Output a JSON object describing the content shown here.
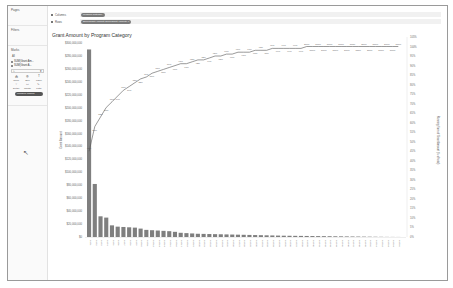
{
  "side_panel": {
    "pages_label": "Pages",
    "filters_label": "Filters",
    "marks_label": "Marks",
    "mark_type": "All",
    "mark_fields": [
      "SUM(Grant Am...",
      "SUM(Grant A..."
    ],
    "mark_buttons": [
      {
        "label": "Color",
        "glyph": "⁂"
      },
      {
        "label": "Size",
        "glyph": "◍"
      },
      {
        "label": "Label",
        "glyph": "T"
      },
      {
        "label": "Detail",
        "glyph": "⁘"
      },
      {
        "label": "Tooltip",
        "glyph": "▭"
      },
      {
        "label": "Path",
        "glyph": "∿"
      }
    ],
    "mark_pill": "Measure Names"
  },
  "shelves": {
    "columns_label": "Columns",
    "columns_pill": "Program Category",
    "rows_label": "Rows",
    "rows_pill": "SUM(Grant Amount)  SUM(Grant Amount) Δ"
  },
  "chart_data": {
    "type": "bar",
    "title": "Grant Amount by Program Category",
    "ylabel": "Grant Amount",
    "y2label": "Running Sum of Grant Amount (% of total)",
    "ylim": [
      0,
      300000000
    ],
    "y2lim": [
      0,
      1.0
    ],
    "y_ticks": [
      "$0",
      "$20,000,000",
      "$40,000,000",
      "$60,000,000",
      "$80,000,000",
      "$100,000,000",
      "$120,000,000",
      "$140,000,000",
      "$160,000,000",
      "$180,000,000",
      "$200,000,000",
      "$220,000,000",
      "$240,000,000",
      "$260,000,000",
      "$280,000,000",
      "$300,000,000"
    ],
    "y2_ticks": [
      "0%",
      "5%",
      "10%",
      "15%",
      "20%",
      "25%",
      "30%",
      "35%",
      "40%",
      "45%",
      "50%",
      "55%",
      "60%",
      "65%",
      "70%",
      "75%",
      "80%",
      "85%",
      "90%",
      "95%",
      "100%",
      "105%"
    ],
    "grid": false,
    "legend": "none",
    "categories": [
      "Cat 1",
      "Cat 2",
      "Cat 3",
      "Cat 4",
      "Cat 5",
      "Cat 6",
      "Cat 7",
      "Cat 8",
      "Cat 9",
      "Cat 10",
      "Cat 11",
      "Cat 12",
      "Cat 13",
      "Cat 14",
      "Cat 15",
      "Cat 16",
      "Cat 17",
      "Cat 18",
      "Cat 19",
      "Cat 20",
      "Cat 21",
      "Cat 22",
      "Cat 23",
      "Cat 24",
      "Cat 25",
      "Cat 26",
      "Cat 27",
      "Cat 28",
      "Cat 29",
      "Cat 30",
      "Cat 31",
      "Cat 32",
      "Cat 33",
      "Cat 34",
      "Cat 35",
      "Cat 36",
      "Cat 37",
      "Cat 38",
      "Cat 39",
      "Cat 40",
      "Cat 41",
      "Cat 42",
      "Cat 43",
      "Cat 44",
      "Cat 45",
      "Cat 46",
      "Cat 47",
      "Cat 48",
      "Cat 49",
      "Cat 50",
      "Cat 51",
      "Cat 52",
      "Cat 53",
      "Cat 54",
      "Cat 55"
    ],
    "series": [
      {
        "name": "SUM(Grant Amount)",
        "type": "bar",
        "values": [
          290000000,
          82000000,
          32000000,
          30000000,
          18000000,
          16000000,
          15500000,
          15000000,
          14500000,
          13000000,
          11000000,
          10500000,
          10000000,
          9500000,
          9000000,
          8000000,
          6500000,
          6000000,
          5500000,
          5000000,
          4800000,
          4600000,
          4400000,
          4200000,
          4000000,
          3800000,
          3600000,
          3400000,
          3200000,
          3000000,
          2800000,
          2600000,
          2400000,
          2200000,
          2000000,
          1900000,
          1800000,
          1700000,
          1600000,
          1500000,
          1400000,
          1300000,
          1200000,
          1100000,
          1000000,
          900000,
          800000,
          700000,
          600000,
          500000,
          400000,
          300000,
          200000,
          150000,
          100000
        ]
      },
      {
        "name": "Running % of total",
        "type": "line",
        "labels": [
          "45%",
          "58%",
          "63%",
          "68%",
          "71%",
          "74%",
          "77%",
          "79%",
          "81%",
          "83%",
          "84%",
          "86%",
          "87%",
          "88%",
          "89%",
          "90%",
          "91%",
          "91%",
          "92%",
          "93%",
          "93%",
          "94%",
          "95%",
          "95%",
          "96%",
          "96%",
          "97%",
          "97%",
          "97%",
          "98%",
          "98%",
          "98%",
          "99%",
          "99%",
          "99%",
          "99%",
          "99%",
          "99%",
          "100%",
          "100%",
          "100%",
          "100%",
          "100%",
          "100%",
          "100%",
          "100%",
          "100%",
          "100%",
          "100%",
          "100%",
          "100%",
          "100%",
          "100%",
          "100%",
          "100%"
        ]
      }
    ]
  },
  "colors": {
    "bar": "#7f7f7f",
    "line": "#555555",
    "axis_text": "#666666"
  }
}
